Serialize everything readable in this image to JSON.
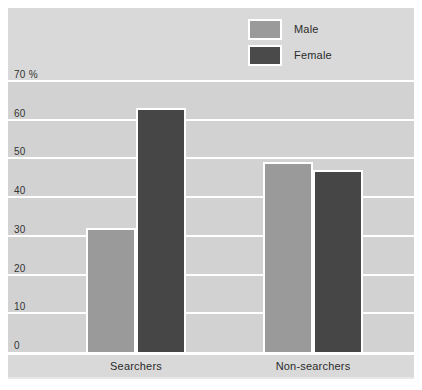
{
  "chart_data": {
    "type": "bar",
    "title": "",
    "subtitle": "",
    "xlabel": "",
    "ylabel": "70 %",
    "unit": "%",
    "categories": [
      "Searchers",
      "Non-searchers"
    ],
    "series": [
      {
        "name": "Male",
        "color": "#9a9a9a",
        "values": [
          32,
          49
        ]
      },
      {
        "name": "Female",
        "color": "#464646",
        "values": [
          63,
          47
        ]
      }
    ],
    "ylim": [
      0,
      70
    ],
    "yticks": [
      0,
      10,
      20,
      30,
      40,
      50,
      60,
      70
    ],
    "ytick_labels": [
      "0",
      "10",
      "20",
      "30",
      "40",
      "50",
      "60",
      "70 %"
    ],
    "grid": true,
    "legend_position": "top-right"
  },
  "legend": {
    "items": [
      {
        "label": "Male",
        "swatch": "male-swatch"
      },
      {
        "label": "Female",
        "swatch": "female-swatch"
      }
    ]
  },
  "axis": {
    "ticks": [
      {
        "label": "70 %",
        "value": 70
      },
      {
        "label": "60",
        "value": 60
      },
      {
        "label": "50",
        "value": 50
      },
      {
        "label": "40",
        "value": 40
      },
      {
        "label": "30",
        "value": 30
      },
      {
        "label": "20",
        "value": 20
      },
      {
        "label": "10",
        "value": 10
      },
      {
        "label": "0",
        "value": 0
      }
    ]
  },
  "categories": [
    {
      "label": "Searchers"
    },
    {
      "label": "Non-searchers"
    }
  ],
  "colors": {
    "male": "#9a9a9a",
    "female": "#464646",
    "panel": "#d9d9d9",
    "plot": "#d2d2d2",
    "grid": "#ffffff",
    "text": "#2b2b2b"
  }
}
